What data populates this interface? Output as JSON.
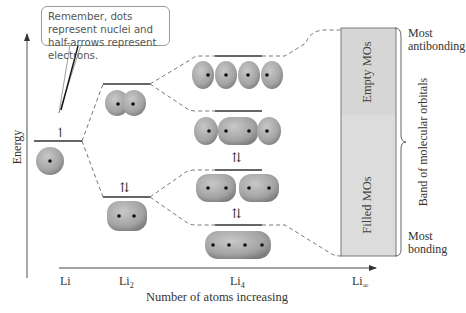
{
  "callout": {
    "text": "Remember, dots represent nuclei and half-arrows represent electrons."
  },
  "axes": {
    "y_label": "Energy",
    "x_label": "Number of atoms increasing"
  },
  "columns": [
    {
      "label": "Li",
      "sub": ""
    },
    {
      "label": "Li",
      "sub": "2"
    },
    {
      "label": "Li",
      "sub": "4"
    },
    {
      "label": "Li",
      "sub": "∞"
    }
  ],
  "band": {
    "empty_label": "Empty MOs",
    "filled_label": "Filled MOs",
    "top_label_line1": "Most",
    "top_label_line2": "antibonding",
    "bottom_label_line1": "Most",
    "bottom_label_line2": "bonding",
    "brace_label": "Band of molecular orbitals",
    "fill_color": "#d9d9d9",
    "border_color": "#7a7a7a"
  },
  "electrons": {
    "li_single": "↿",
    "pair": "⇅"
  },
  "colors": {
    "orbital_fill": "#a9a9a9",
    "orbital_dark": "#7e7e7e",
    "nucleus": "#111111",
    "line": "#333333",
    "dashed": "#555555"
  }
}
